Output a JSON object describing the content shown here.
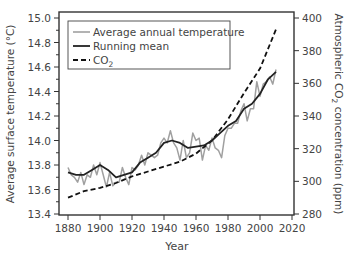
{
  "chart_data": {
    "type": "line",
    "title": "",
    "xlabel": "Year",
    "ylabel": "Average surface temperature (°C)",
    "ylabel_right": "Atmospheric CO₂ concentration (ppm)",
    "xlim": [
      1875,
      2020
    ],
    "ylim": [
      13.4,
      15.0
    ],
    "ylim_right": [
      280,
      400
    ],
    "x_ticks": [
      1880,
      1900,
      1920,
      1940,
      1960,
      1980,
      2000,
      2020
    ],
    "y_ticks": [
      13.4,
      13.6,
      13.8,
      14.0,
      14.2,
      14.4,
      14.6,
      14.8,
      15.0
    ],
    "y_ticks_right": [
      280,
      300,
      320,
      340,
      360,
      380,
      400
    ],
    "grid": false,
    "legend_position": "upper left",
    "legend": [
      "Average annual temperature",
      "Running mean",
      "CO₂"
    ],
    "series": [
      {
        "name": "Average annual temperature",
        "axis": "left",
        "color": "#a0a0a0",
        "x": [
          1880,
          1882,
          1884,
          1886,
          1888,
          1890,
          1892,
          1894,
          1896,
          1898,
          1900,
          1902,
          1904,
          1906,
          1908,
          1910,
          1912,
          1914,
          1916,
          1918,
          1920,
          1922,
          1924,
          1926,
          1928,
          1930,
          1932,
          1934,
          1936,
          1938,
          1940,
          1942,
          1944,
          1946,
          1948,
          1950,
          1952,
          1954,
          1956,
          1958,
          1960,
          1962,
          1964,
          1966,
          1968,
          1970,
          1972,
          1974,
          1976,
          1978,
          1980,
          1982,
          1984,
          1986,
          1988,
          1990,
          1992,
          1994,
          1996,
          1998,
          2000,
          2002,
          2004,
          2006,
          2008,
          2010
        ],
        "values": [
          13.78,
          13.72,
          13.7,
          13.66,
          13.74,
          13.64,
          13.72,
          13.7,
          13.8,
          13.72,
          13.82,
          13.72,
          13.62,
          13.74,
          13.63,
          13.66,
          13.66,
          13.78,
          13.7,
          13.64,
          13.78,
          13.76,
          13.8,
          13.88,
          13.8,
          13.9,
          13.88,
          13.86,
          13.88,
          13.98,
          14.02,
          13.98,
          14.08,
          13.98,
          13.94,
          13.84,
          14.0,
          13.86,
          13.9,
          14.06,
          14.0,
          14.02,
          13.84,
          13.96,
          13.92,
          14.02,
          13.94,
          13.92,
          13.86,
          14.04,
          14.1,
          14.1,
          14.14,
          14.14,
          14.24,
          14.3,
          14.16,
          14.26,
          14.26,
          14.48,
          14.36,
          14.46,
          14.48,
          14.52,
          14.46,
          14.58
        ]
      },
      {
        "name": "Running mean",
        "axis": "left",
        "color": "#222222",
        "x": [
          1880,
          1885,
          1890,
          1895,
          1900,
          1905,
          1910,
          1915,
          1920,
          1925,
          1930,
          1935,
          1940,
          1945,
          1950,
          1955,
          1960,
          1965,
          1970,
          1975,
          1980,
          1985,
          1990,
          1995,
          2000,
          2005,
          2010
        ],
        "values": [
          13.74,
          13.72,
          13.72,
          13.76,
          13.8,
          13.76,
          13.7,
          13.72,
          13.74,
          13.82,
          13.86,
          13.9,
          13.98,
          14.0,
          13.98,
          13.94,
          13.95,
          13.96,
          14.0,
          14.06,
          14.12,
          14.16,
          14.26,
          14.3,
          14.38,
          14.5,
          14.56
        ]
      },
      {
        "name": "CO₂",
        "axis": "right",
        "color": "#111111",
        "dash": true,
        "x": [
          1880,
          1890,
          1900,
          1910,
          1920,
          1930,
          1940,
          1950,
          1960,
          1970,
          1980,
          1990,
          2000,
          2010
        ],
        "values": [
          290,
          294,
          296,
          299,
          303,
          306,
          309,
          312,
          317,
          325,
          338,
          354,
          369,
          393
        ]
      }
    ]
  }
}
